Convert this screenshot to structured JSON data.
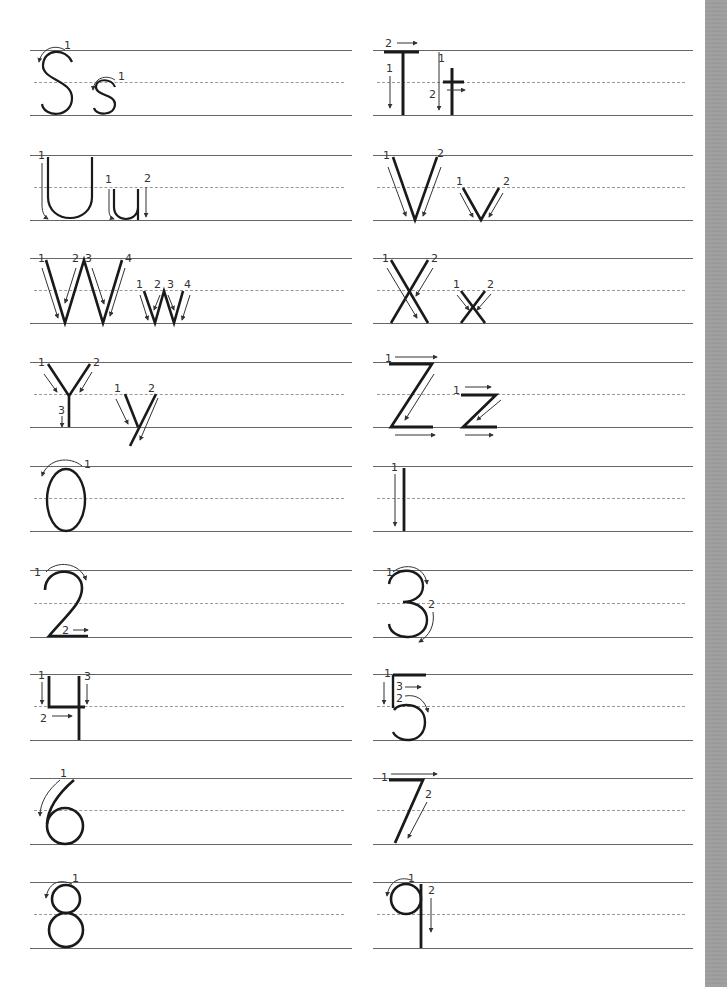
{
  "worksheet": {
    "type": "handwriting-practice",
    "colors": {
      "ink": "#1a1a1a",
      "guide_line": "#666666",
      "dashed_line": "#9a9a9a",
      "arrow": "#333333",
      "edge_strip": "#9a9a9a"
    },
    "rows": [
      {
        "left": {
          "characters": "Ss",
          "strokes": [
            "1",
            "1"
          ]
        },
        "right": {
          "characters": "Tt",
          "strokes": [
            "1",
            "2",
            "1",
            "2"
          ]
        }
      },
      {
        "left": {
          "characters": "Uu",
          "strokes": [
            "1",
            "1",
            "2"
          ]
        },
        "right": {
          "characters": "Vv",
          "strokes": [
            "1",
            "2",
            "1",
            "2"
          ]
        }
      },
      {
        "left": {
          "characters": "Ww",
          "strokes": [
            "1",
            "2",
            "3",
            "4",
            "1",
            "2",
            "3",
            "4"
          ]
        },
        "right": {
          "characters": "Xx",
          "strokes": [
            "1",
            "2",
            "1",
            "2"
          ]
        }
      },
      {
        "left": {
          "characters": "Yy",
          "strokes": [
            "1",
            "2",
            "3",
            "1",
            "2"
          ]
        },
        "right": {
          "characters": "Zz",
          "strokes": [
            "1",
            "1"
          ]
        }
      },
      {
        "left": {
          "characters": "0",
          "strokes": [
            "1"
          ]
        },
        "right": {
          "characters": "1",
          "strokes": [
            "1"
          ]
        }
      },
      {
        "left": {
          "characters": "2",
          "strokes": [
            "1",
            "2"
          ]
        },
        "right": {
          "characters": "3",
          "strokes": [
            "1",
            "2"
          ]
        }
      },
      {
        "left": {
          "characters": "4",
          "strokes": [
            "1",
            "2",
            "3"
          ]
        },
        "right": {
          "characters": "5",
          "strokes": [
            "1",
            "2",
            "3"
          ]
        }
      },
      {
        "left": {
          "characters": "6",
          "strokes": [
            "1"
          ]
        },
        "right": {
          "characters": "7",
          "strokes": [
            "1",
            "2"
          ]
        }
      },
      {
        "left": {
          "characters": "8",
          "strokes": [
            "1"
          ]
        },
        "right": {
          "characters": "9",
          "strokes": [
            "1",
            "2"
          ]
        }
      }
    ]
  }
}
